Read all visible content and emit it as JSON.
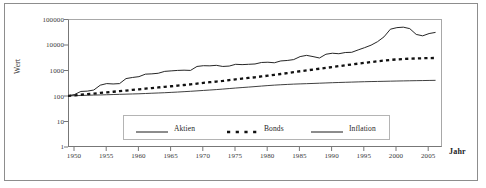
{
  "chart_data": {
    "type": "line",
    "title": "",
    "subtitle": "",
    "xlabel": "Jahr",
    "ylabel": "Wert",
    "yscale": "log",
    "ylim": [
      1,
      100000
    ],
    "xlim": [
      1950,
      2008
    ],
    "grid": false,
    "legend_position": "inside-bottom-center",
    "ytick_labels": [
      "100000",
      "10000",
      "1000",
      "100",
      "10",
      "1"
    ],
    "ytick_values": [
      100000,
      10000,
      1000,
      100,
      10,
      1
    ],
    "xtick_labels": [
      "1950",
      "1955",
      "1960",
      "1965",
      "1970",
      "1975",
      "1980",
      "1985",
      "1990",
      "1995",
      "2000",
      "2005"
    ],
    "xtick_values": [
      1950,
      1955,
      1960,
      1965,
      1970,
      1975,
      1980,
      1985,
      1990,
      1995,
      2000,
      2005
    ],
    "x": [
      1950,
      1951,
      1952,
      1953,
      1954,
      1955,
      1956,
      1957,
      1958,
      1959,
      1960,
      1961,
      1962,
      1963,
      1964,
      1965,
      1966,
      1967,
      1968,
      1969,
      1970,
      1971,
      1972,
      1973,
      1974,
      1975,
      1976,
      1977,
      1978,
      1979,
      1980,
      1981,
      1982,
      1983,
      1984,
      1985,
      1986,
      1987,
      1988,
      1989,
      1990,
      1991,
      1992,
      1993,
      1994,
      1995,
      1996,
      1997,
      1998,
      1999,
      2000,
      2001,
      2002,
      2003,
      2004,
      2005,
      2006,
      2007
    ],
    "series": [
      {
        "name": "Aktien",
        "style": "solid-thin",
        "color": "#1a1a1a",
        "values": [
          100,
          112,
          148,
          152,
          168,
          260,
          300,
          290,
          300,
          470,
          520,
          560,
          700,
          720,
          760,
          900,
          940,
          980,
          1000,
          980,
          1400,
          1500,
          1480,
          1550,
          1400,
          1450,
          1700,
          1650,
          1700,
          1750,
          2000,
          2050,
          1950,
          2300,
          2400,
          2600,
          3400,
          3800,
          3400,
          3000,
          4200,
          4600,
          4400,
          4900,
          5000,
          6200,
          7600,
          9500,
          13000,
          20000,
          40000,
          46000,
          48000,
          42000,
          25000,
          22000,
          27000,
          30000
        ]
      },
      {
        "name": "Bonds",
        "style": "dashed-thick",
        "color": "#111111",
        "values": [
          100,
          104,
          110,
          116,
          122,
          130,
          136,
          144,
          152,
          160,
          170,
          180,
          190,
          200,
          212,
          224,
          236,
          250,
          264,
          280,
          300,
          320,
          340,
          360,
          380,
          410,
          440,
          470,
          500,
          530,
          570,
          610,
          660,
          710,
          770,
          840,
          910,
          980,
          1060,
          1140,
          1230,
          1330,
          1440,
          1560,
          1680,
          1800,
          1940,
          2080,
          2230,
          2380,
          2520,
          2640,
          2740,
          2820,
          2880,
          2930,
          2970,
          3000
        ]
      },
      {
        "name": "Inflation",
        "style": "solid-thin",
        "color": "#2a2a2a",
        "values": [
          100,
          101,
          103,
          105,
          107,
          108,
          110,
          112,
          114,
          116,
          118,
          120,
          123,
          126,
          129,
          132,
          136,
          140,
          145,
          150,
          156,
          162,
          168,
          175,
          183,
          192,
          201,
          210,
          219,
          229,
          240,
          251,
          261,
          270,
          278,
          286,
          292,
          298,
          304,
          311,
          318,
          325,
          331,
          337,
          343,
          349,
          355,
          360,
          364,
          368,
          373,
          378,
          382,
          386,
          390,
          394,
          398,
          402
        ]
      }
    ]
  },
  "axes": {
    "ylabel_text": "Wert",
    "xlabel_text": "Jahr"
  },
  "legend": {
    "entries": [
      {
        "label": "Aktien",
        "sample": "solid-line-sample"
      },
      {
        "label": "Bonds",
        "sample": "dashed-line-sample"
      },
      {
        "label": "Inflation",
        "sample": "solid-line-sample"
      }
    ]
  }
}
